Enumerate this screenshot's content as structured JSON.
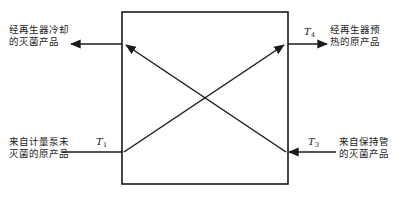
{
  "diagram": {
    "type": "regenerator-heat-exchanger-flow-diagram",
    "vessel": {
      "name": "regenerator-box",
      "x": 122,
      "y": 12,
      "width": 166,
      "height": 172,
      "stroke": "#1a1a1a",
      "stroke_width": 1.6,
      "fill": "#ffffff"
    },
    "streams": [
      {
        "id": "cooled-sterile-product-out",
        "label": "经再生器冷却\n的灭菌产品",
        "position": "top-left",
        "direction": "out",
        "temperature_label": null
      },
      {
        "id": "preheated-raw-product-out",
        "label": "经再生器预\n热的原产品",
        "position": "top-right",
        "direction": "out",
        "temperature_label": "T",
        "temperature_subscript": "4"
      },
      {
        "id": "unsterilized-raw-product-in",
        "label": "来自计量泵未\n灭菌的原产品",
        "position": "bottom-left",
        "direction": "in",
        "temperature_label": "T",
        "temperature_subscript": "1"
      },
      {
        "id": "sterile-product-from-holding-tube-in",
        "label": "来自保持管\n的灭菌产品",
        "position": "bottom-right",
        "direction": "in",
        "temperature_label": "T",
        "temperature_subscript": "3"
      }
    ],
    "internal_flows": [
      {
        "id": "raw-product-diagonal",
        "from": "bottom-left-corner",
        "to": "top-right-corner",
        "arrowhead": "end"
      },
      {
        "id": "sterile-product-diagonal",
        "from": "bottom-right-corner",
        "to": "top-left-corner",
        "arrowhead": "end"
      }
    ],
    "colors": {
      "line": "#1a1a1a",
      "text": "#1a1a1a",
      "background": "#ffffff"
    }
  }
}
